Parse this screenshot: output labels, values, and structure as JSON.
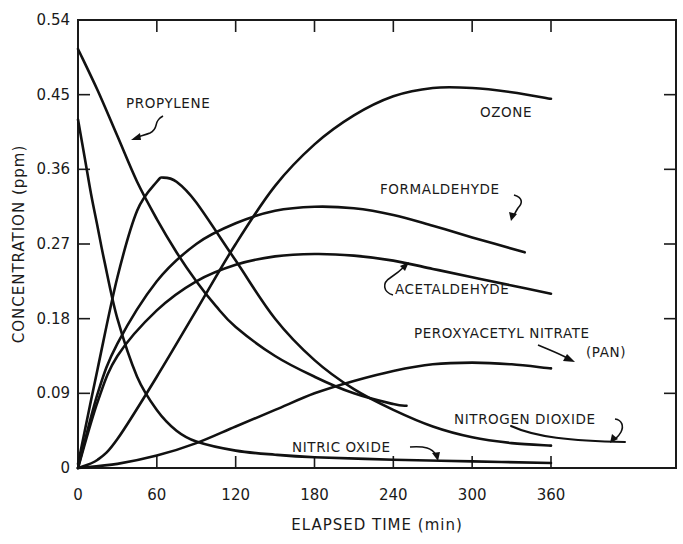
{
  "chart_data": {
    "type": "line",
    "title": "",
    "xlabel": "ELAPSED TIME (min)",
    "ylabel": "CONCENTRATION (ppm)",
    "xlim": [
      0,
      400
    ],
    "ylim": [
      0,
      0.54
    ],
    "x_ticks": [
      0,
      60,
      120,
      180,
      240,
      300,
      360
    ],
    "x_tick_labels": [
      "0",
      "60",
      "120",
      "180",
      "240",
      "300",
      "360"
    ],
    "y_ticks": [
      0,
      0.09,
      0.18,
      0.27,
      0.36,
      0.45,
      0.54
    ],
    "y_tick_labels": [
      "0",
      "0.09",
      "0.18",
      "0.27",
      "0.36",
      "0.45",
      "0.54"
    ],
    "grid": false,
    "legend": "inline annotations",
    "series": [
      {
        "name": "PROPYLENE",
        "x": [
          0,
          15,
          30,
          45,
          60,
          75,
          90,
          105,
          120,
          150,
          180,
          210,
          240,
          250
        ],
        "y": [
          0.505,
          0.455,
          0.4,
          0.345,
          0.3,
          0.26,
          0.225,
          0.195,
          0.17,
          0.135,
          0.11,
          0.09,
          0.077,
          0.075
        ]
      },
      {
        "name": "NITRIC OXIDE",
        "x": [
          0,
          5,
          10,
          15,
          20,
          30,
          45,
          60,
          75,
          90,
          120,
          150,
          180,
          240,
          300,
          360
        ],
        "y": [
          0.42,
          0.375,
          0.33,
          0.29,
          0.25,
          0.18,
          0.11,
          0.07,
          0.045,
          0.032,
          0.021,
          0.016,
          0.013,
          0.01,
          0.008,
          0.006
        ]
      },
      {
        "name": "NITROGEN DIOXIDE",
        "x": [
          0,
          15,
          30,
          45,
          60,
          65,
          75,
          90,
          120,
          150,
          180,
          210,
          240,
          270,
          300,
          330,
          360
        ],
        "y": [
          0.005,
          0.12,
          0.23,
          0.31,
          0.345,
          0.35,
          0.345,
          0.32,
          0.25,
          0.18,
          0.13,
          0.095,
          0.07,
          0.05,
          0.037,
          0.03,
          0.027
        ]
      },
      {
        "name": "OZONE",
        "x": [
          0,
          15,
          30,
          60,
          90,
          120,
          150,
          180,
          210,
          240,
          270,
          300,
          330,
          360
        ],
        "y": [
          0.0,
          0.01,
          0.035,
          0.11,
          0.19,
          0.27,
          0.34,
          0.39,
          0.425,
          0.448,
          0.458,
          0.458,
          0.453,
          0.445
        ]
      },
      {
        "name": "FORMALDEHYDE",
        "x": [
          0,
          15,
          30,
          60,
          90,
          120,
          150,
          180,
          210,
          240,
          270,
          300,
          340
        ],
        "y": [
          0.0,
          0.09,
          0.15,
          0.225,
          0.27,
          0.295,
          0.31,
          0.315,
          0.313,
          0.305,
          0.292,
          0.278,
          0.26
        ]
      },
      {
        "name": "ACETALDEHYDE",
        "x": [
          0,
          15,
          30,
          60,
          90,
          120,
          150,
          180,
          210,
          240,
          270,
          300,
          330,
          360
        ],
        "y": [
          0.0,
          0.08,
          0.135,
          0.19,
          0.225,
          0.245,
          0.255,
          0.258,
          0.256,
          0.25,
          0.24,
          0.23,
          0.22,
          0.21
        ]
      },
      {
        "name": "PEROXYACETYL NITRATE (PAN)",
        "x": [
          0,
          30,
          60,
          90,
          120,
          150,
          180,
          210,
          240,
          270,
          300,
          330,
          360
        ],
        "y": [
          0.0,
          0.005,
          0.015,
          0.03,
          0.05,
          0.07,
          0.09,
          0.105,
          0.117,
          0.125,
          0.127,
          0.125,
          0.12
        ]
      }
    ],
    "annotations": [
      {
        "text": "PROPYLENE",
        "series": "PROPYLENE"
      },
      {
        "text": "OZONE",
        "series": "OZONE"
      },
      {
        "text": "FORMALDEHYDE",
        "series": "FORMALDEHYDE"
      },
      {
        "text": "ACETALDEHYDE",
        "series": "ACETALDEHYDE"
      },
      {
        "text": "PEROXYACETYL NITRATE",
        "series": "PEROXYACETYL NITRATE (PAN)"
      },
      {
        "text": "(PAN)",
        "series": "PEROXYACETYL NITRATE (PAN)"
      },
      {
        "text": "NITROGEN DIOXIDE",
        "series": "NITROGEN DIOXIDE"
      },
      {
        "text": "NITRIC OXIDE",
        "series": "NITRIC OXIDE"
      }
    ]
  },
  "labels": {
    "xlabel": "ELAPSED TIME (min)",
    "ylabel": "CONCENTRATION (ppm)",
    "propylene": "PROPYLENE",
    "ozone": "OZONE",
    "formaldehyde": "FORMALDEHYDE",
    "acetaldehyde": "ACETALDEHYDE",
    "pan_line1": "PEROXYACETYL NITRATE",
    "pan_line2": "(PAN)",
    "nitrogen_dioxide": "NITROGEN DIOXIDE",
    "nitric_oxide": "NITRIC OXIDE"
  }
}
